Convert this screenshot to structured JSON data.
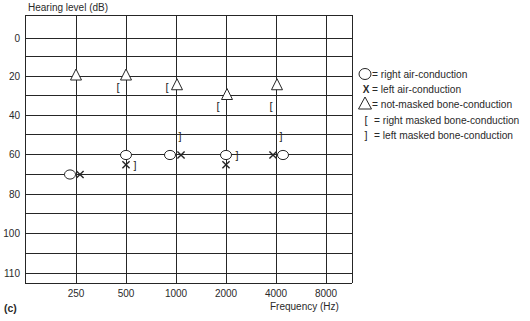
{
  "figure": {
    "panel_label": "(c)",
    "y_title": "Hearing level (dB)",
    "x_title": "Frequency (Hz)"
  },
  "legend": {
    "items": [
      {
        "symbol": "circle",
        "label": "= right air-conduction"
      },
      {
        "symbol": "x",
        "label": "= left air-conduction"
      },
      {
        "symbol": "triangle",
        "label": "= not-masked bone-conduction"
      },
      {
        "symbol": "left-bracket",
        "label": "= right masked bone-conduction"
      },
      {
        "symbol": "right-bracket",
        "label": "= left masked bone-conduction"
      }
    ]
  },
  "chart_data": {
    "type": "scatter",
    "title": "",
    "xlabel": "Frequency (Hz)",
    "ylabel": "Hearing level (dB)",
    "x_ticks": [
      "250",
      "500",
      "1000",
      "2000",
      "4000",
      "8000"
    ],
    "y_ticks": [
      "0",
      "20",
      "40",
      "60",
      "80",
      "100",
      "110"
    ],
    "y_inverted": true,
    "grid": true,
    "legend_position": "right",
    "series": [
      {
        "name": "right air-conduction",
        "symbol": "circle",
        "points": [
          {
            "freq": 250,
            "db": 70,
            "dx": -6
          },
          {
            "freq": 500,
            "db": 60,
            "dx": 0
          },
          {
            "freq": 1000,
            "db": 60,
            "dx": -6
          },
          {
            "freq": 2000,
            "db": 60,
            "dx": 0
          },
          {
            "freq": 4000,
            "db": 60,
            "dx": 7
          }
        ]
      },
      {
        "name": "left air-conduction",
        "symbol": "x",
        "points": [
          {
            "freq": 250,
            "db": 70,
            "dx": 4
          },
          {
            "freq": 500,
            "db": 65,
            "dx": 0
          },
          {
            "freq": 1000,
            "db": 60,
            "dx": 5
          },
          {
            "freq": 2000,
            "db": 65,
            "dx": 0
          },
          {
            "freq": 4000,
            "db": 60,
            "dx": -3
          }
        ]
      },
      {
        "name": "not-masked bone-conduction",
        "symbol": "triangle",
        "points": [
          {
            "freq": 250,
            "db": 20,
            "dx": 0
          },
          {
            "freq": 500,
            "db": 20,
            "dx": 0
          },
          {
            "freq": 1000,
            "db": 25,
            "dx": 1
          },
          {
            "freq": 2000,
            "db": 30,
            "dx": 1
          },
          {
            "freq": 4000,
            "db": 25,
            "dx": 1
          }
        ]
      },
      {
        "name": "right masked bone-conduction",
        "symbol": "left-bracket",
        "points": [
          {
            "freq": 500,
            "db": 25,
            "dx": -8
          },
          {
            "freq": 1000,
            "db": 25,
            "dx": -9
          },
          {
            "freq": 2000,
            "db": 35,
            "dx": -8
          },
          {
            "freq": 4000,
            "db": 35,
            "dx": -5
          }
        ]
      },
      {
        "name": "left masked bone-conduction",
        "symbol": "right-bracket",
        "points": [
          {
            "freq": 500,
            "db": 65,
            "dx": 9
          },
          {
            "freq": 1000,
            "db": 50,
            "dx": 4
          },
          {
            "freq": 2000,
            "db": 60,
            "dx": 11
          },
          {
            "freq": 4000,
            "db": 50,
            "dx": 5
          }
        ]
      }
    ]
  }
}
